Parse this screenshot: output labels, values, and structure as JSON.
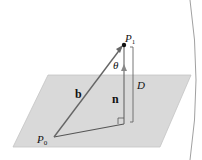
{
  "diagram": {
    "labels": {
      "p1": "P",
      "p1_sub": "1",
      "p0": "P",
      "p0_sub": "0",
      "theta": "θ",
      "b": "b",
      "n": "n",
      "D": "D"
    },
    "colors": {
      "plane_fill": "#d9d9d9",
      "plane_stroke": "#bdbdbd",
      "line": "#555555",
      "point": "#111111",
      "background": "#ffffff"
    }
  }
}
